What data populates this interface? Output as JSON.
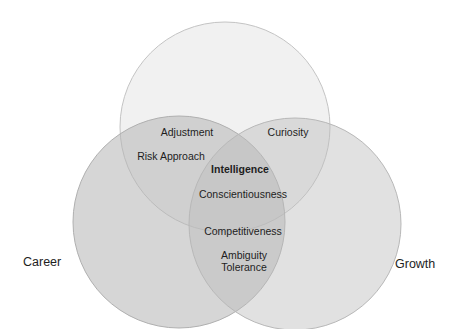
{
  "diagram": {
    "type": "venn",
    "sets": [
      {
        "id": "top",
        "name": "",
        "cx": 225,
        "cy": 127,
        "r": 105
      },
      {
        "id": "career",
        "name": "Career",
        "cx": 179,
        "cy": 222,
        "r": 106
      },
      {
        "id": "growth",
        "name": "Growth",
        "cx": 295,
        "cy": 224,
        "r": 106
      }
    ],
    "colors": {
      "top_fill": "#f2f2f2",
      "side_fill": "#c9c9c9",
      "stroke": "#b8b8b8",
      "text": "#1e1e1e"
    },
    "labels": {
      "adjustment": "Adjustment",
      "risk_approach": "Risk Approach",
      "curiosity": "Curiosity",
      "intelligence": "Intelligence",
      "conscientiousness": "Conscientiousness",
      "competitiveness": "Competitiveness",
      "ambiguity_line1": "Ambiguity",
      "ambiguity_line2": "Tolerance",
      "career": "Career",
      "growth": "Growth"
    }
  }
}
